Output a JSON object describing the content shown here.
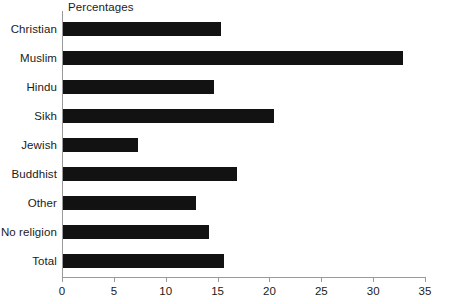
{
  "chart_data": {
    "type": "bar",
    "orientation": "horizontal",
    "title": "Percentages",
    "xlabel": "",
    "ylabel": "",
    "xlim": [
      0,
      35
    ],
    "grid": false,
    "legend": null,
    "bar_color": "#121212",
    "axis_color": "#9a9a9a",
    "x_ticks": [
      0,
      5,
      10,
      15,
      20,
      25,
      30,
      35
    ],
    "x_tick_labels": [
      "0",
      "5",
      "10",
      "15",
      "20",
      "25",
      "30",
      "35"
    ],
    "categories": [
      "Christian",
      "Muslim",
      "Hindu",
      "Sikh",
      "Jewish",
      "Buddhist",
      "Other",
      "No religion",
      "Total"
    ],
    "values": [
      15.2,
      32.8,
      14.6,
      20.3,
      7.2,
      16.8,
      12.8,
      14.1,
      15.5
    ],
    "bars": [
      {
        "label": "Christian",
        "value": 15.2
      },
      {
        "label": "Muslim",
        "value": 32.8
      },
      {
        "label": "Hindu",
        "value": 14.6
      },
      {
        "label": "Sikh",
        "value": 20.3
      },
      {
        "label": "Jewish",
        "value": 7.2
      },
      {
        "label": "Buddhist",
        "value": 16.8
      },
      {
        "label": "Other",
        "value": 12.8
      },
      {
        "label": "No religion",
        "value": 14.1
      },
      {
        "label": "Total",
        "value": 15.5
      }
    ]
  }
}
